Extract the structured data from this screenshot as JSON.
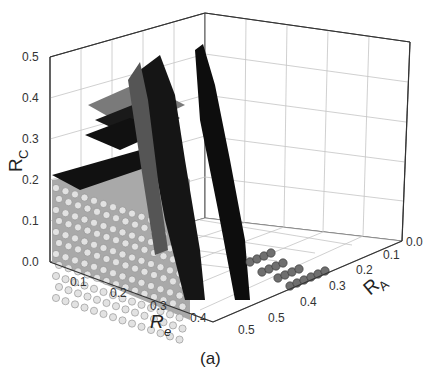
{
  "chart_data": {
    "type": "scatter3d",
    "title": "",
    "caption": "(a)",
    "axes": {
      "x": {
        "label": "R_e",
        "label_main": "R",
        "label_sub": "e",
        "range": [
          0.0,
          0.5
        ],
        "ticks": [
          "0.1",
          "0.2",
          "0.3",
          "0.4",
          "0.5"
        ]
      },
      "y": {
        "label": "R_A",
        "label_main": "R",
        "label_sub": "A",
        "range": [
          0.0,
          0.5
        ],
        "ticks": [
          "0.0",
          "0.1",
          "0.2",
          "0.3",
          "0.4",
          "0.5"
        ]
      },
      "z": {
        "label": "R_C",
        "label_main": "R",
        "label_sub": "C",
        "range": [
          0.0,
          0.5
        ],
        "ticks": [
          "0.0",
          "0.1",
          "0.2",
          "0.3",
          "0.4",
          "0.5"
        ]
      }
    },
    "grid": true,
    "legend": null,
    "series": [
      {
        "name": "light-gray region",
        "color": "#c8c8c8",
        "description": "block filling R_e 0.0-0.35, R_A ~0.5, R_C 0.0-0.2"
      },
      {
        "name": "dark-gray region",
        "color": "#6e6e6e",
        "description": "scattered points, terraces near R_C 0.3-0.4 and floor rows near R_A 0.2-0.35"
      },
      {
        "name": "black region",
        "color": "#111111",
        "description": "sheets rising to R_C ~0.5 near R_e 0.25-0.4"
      }
    ]
  }
}
